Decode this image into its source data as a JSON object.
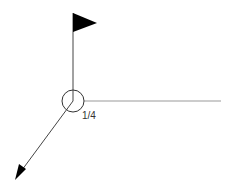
{
  "diagram": {
    "type": "isometric-pipe-symbol",
    "label": "1/4",
    "colors": {
      "stroke": "#333333",
      "horizontal_line": "#9a9a9a",
      "fill": "#000000",
      "background": "#ffffff"
    },
    "elements": [
      {
        "name": "flag",
        "description": "black triangular flag at top of vertical line"
      },
      {
        "name": "vertical-line",
        "description": "vertical line from flag to circle"
      },
      {
        "name": "circle",
        "description": "open circle at junction"
      },
      {
        "name": "horizontal-line",
        "description": "gray line extending right from circle"
      },
      {
        "name": "diagonal-arrow",
        "description": "line from circle toward lower-left ending in arrowhead"
      }
    ]
  }
}
